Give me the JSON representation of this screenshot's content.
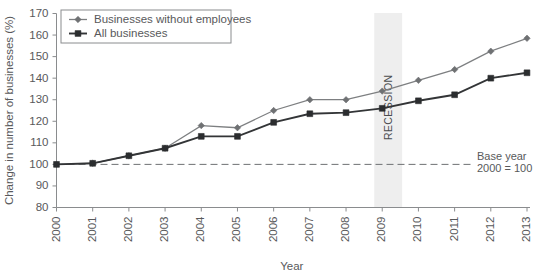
{
  "chart_data": {
    "type": "line",
    "title": "",
    "subtitle": "",
    "xlabel": "Year",
    "ylabel": "Change in number of businesses (%)",
    "x": [
      2000,
      2001,
      2002,
      2003,
      2004,
      2005,
      2006,
      2007,
      2008,
      2009,
      2010,
      2011,
      2012,
      2013
    ],
    "categories": [
      "2000",
      "2001",
      "2002",
      "2003",
      "2004",
      "2005",
      "2006",
      "2007",
      "2008",
      "2009",
      "2010",
      "2011",
      "2012",
      "2013"
    ],
    "xlim": [
      2000,
      2013
    ],
    "ylim": [
      80,
      170
    ],
    "yticks": [
      80,
      90,
      100,
      110,
      120,
      130,
      140,
      150,
      160,
      170
    ],
    "grid": false,
    "legend_position": "top-left",
    "series": [
      {
        "name": "Businesses without employees",
        "marker": "diamond",
        "color": "#6f7173",
        "values": [
          100,
          100.5,
          104,
          107.5,
          118,
          117,
          125,
          130,
          130,
          134,
          139,
          144,
          152.5,
          158.5
        ]
      },
      {
        "name": "All businesses",
        "marker": "square",
        "color": "#2b2d2f",
        "values": [
          100,
          100.5,
          104,
          107.5,
          113,
          113,
          119.5,
          123.5,
          124,
          126,
          129.5,
          132.3,
          140,
          142.5
        ]
      }
    ],
    "annotations": [
      {
        "name": "baseline-reference",
        "type": "hline",
        "y": 100,
        "label_line_1": "Base year",
        "label_line_2": "2000 = 100"
      },
      {
        "name": "recession-band",
        "type": "vband",
        "x_start": 2008.78,
        "x_end": 2009.55,
        "label": "RECESSION",
        "color": "#eeeeee"
      }
    ]
  },
  "axes": {
    "y_label": "Change in number of businesses (%)",
    "x_label": "Year",
    "y_tick_labels": [
      "170",
      "160",
      "150",
      "140",
      "130",
      "120",
      "110",
      "100",
      "90",
      "80"
    ],
    "x_tick_labels": [
      "2000",
      "2001",
      "2002",
      "2003",
      "2004",
      "2005",
      "2006",
      "2007",
      "2008",
      "2009",
      "2010",
      "2011",
      "2012",
      "2013"
    ]
  },
  "legend": {
    "items": [
      {
        "label": "Businesses without employees",
        "marker": "diamond"
      },
      {
        "label": "All businesses",
        "marker": "square"
      }
    ]
  },
  "annotation_labels": {
    "base_year_line1": "Base year",
    "base_year_line2": "2000 = 100",
    "recession": "RECESSION"
  },
  "colors": {
    "series_a": "#6f7173",
    "series_b": "#2b2d2f",
    "axis": "#8a8c8e",
    "text": "#58595b",
    "band": "#eeeeee",
    "background": "#ffffff"
  }
}
